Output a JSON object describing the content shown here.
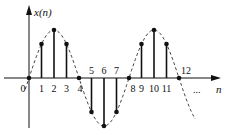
{
  "chart_data": {
    "type": "stem",
    "title": "",
    "ylabel": "x(n)",
    "xlabel": "n",
    "x": [
      0,
      1,
      2,
      3,
      4,
      5,
      6,
      7,
      8,
      9,
      10,
      11,
      12
    ],
    "values": [
      0,
      0.707,
      1,
      0.707,
      0,
      -0.707,
      -1,
      -0.707,
      0,
      0.707,
      1,
      0.707,
      0
    ],
    "envelope": "dashed sinusoid, period 8",
    "tick_labels": [
      "0",
      "1",
      "2",
      "3",
      "4",
      "5",
      "6",
      "7",
      "8",
      "9",
      "10",
      "11",
      "12"
    ],
    "continuation": "...",
    "ylim": [
      -1.1,
      1.3
    ]
  },
  "labels": {
    "y_axis": "x(n)",
    "x_axis": "n",
    "ellipsis": "..."
  }
}
